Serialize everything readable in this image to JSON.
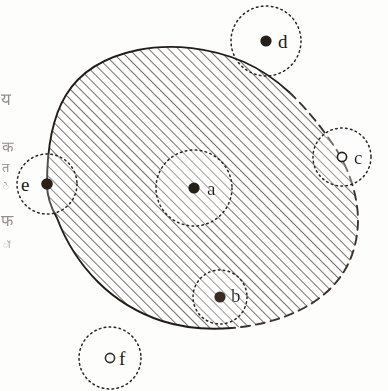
{
  "figure": {
    "background_color": "#fdfdfc",
    "ink_color": "#1a1714",
    "hatch_color": "#5d5750",
    "width": 388,
    "height": 391
  },
  "region": {
    "name": "shaded-set",
    "fill": "diagonal-hatch",
    "hatch_angle_deg": 45,
    "hatch_spacing_px": 7,
    "boundary_solid_color": "#211d19",
    "boundary_dashed_color": "#3a342e",
    "boundary_note_solid": "closed portion of boundary (included in set)",
    "boundary_note_dashed": "open portion of boundary (excluded from set)"
  },
  "points": [
    {
      "id": "a",
      "label": "a",
      "marker": "filled",
      "cx": 194,
      "cy": 188,
      "label_x": 207,
      "label_y": 195,
      "circle_r": 38,
      "circle_style": "dotted",
      "position": "interior"
    },
    {
      "id": "b",
      "label": "b",
      "marker": "filled",
      "cx": 220,
      "cy": 297,
      "label_x": 231,
      "label_y": 302,
      "circle_r": 27,
      "circle_style": "dotted",
      "position": "boundary"
    },
    {
      "id": "c",
      "label": "c",
      "marker": "hollow",
      "cx": 342,
      "cy": 157,
      "label_x": 354,
      "label_y": 164,
      "circle_r": 29,
      "circle_style": "dotted",
      "position": "boundary-open"
    },
    {
      "id": "d",
      "label": "d",
      "marker": "filled",
      "cx": 266,
      "cy": 41,
      "label_x": 278,
      "label_y": 48,
      "circle_r": 35,
      "circle_style": "dotted",
      "position": "exterior"
    },
    {
      "id": "e",
      "label": "e",
      "marker": "filled",
      "cx": 47,
      "cy": 184,
      "label_x": 21,
      "label_y": 191,
      "circle_r": 30,
      "circle_style": "dotted",
      "position": "boundary"
    },
    {
      "id": "f",
      "label": "f",
      "marker": "hollow",
      "cx": 110,
      "cy": 358,
      "label_x": 119,
      "label_y": 365,
      "circle_r": 31,
      "circle_style": "dotted",
      "position": "exterior"
    }
  ],
  "margin_glyphs": [
    {
      "text": "य",
      "x": 1,
      "y": 105,
      "size": 17
    },
    {
      "text": "क",
      "x": 2,
      "y": 152,
      "size": 15
    },
    {
      "text": "त",
      "x": 2,
      "y": 172,
      "size": 13
    },
    {
      "text": "े",
      "x": 3,
      "y": 190,
      "size": 10
    },
    {
      "text": "फ",
      "x": 1,
      "y": 226,
      "size": 16
    },
    {
      "text": "ॉ",
      "x": 3,
      "y": 248,
      "size": 9
    }
  ]
}
